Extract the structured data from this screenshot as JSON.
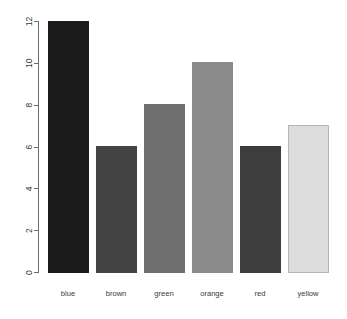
{
  "chart_data": {
    "type": "bar",
    "title": "",
    "subtitle": "",
    "xlabel": "",
    "ylabel": "",
    "categories": [
      "blue",
      "brown",
      "green",
      "orange",
      "red",
      "yellow"
    ],
    "values": [
      12,
      6,
      8,
      10,
      6,
      7
    ],
    "ylim": [
      0,
      12
    ],
    "yticks": [
      0,
      2,
      4,
      6,
      8,
      10,
      12
    ],
    "ytick_labels": [
      "0",
      "2",
      "4",
      "6",
      "8",
      "10",
      "12"
    ],
    "grid": false,
    "legend": false,
    "legend_position": "none",
    "y_axis_label_rotation": 90,
    "bar_colors": [
      "#1a1a1a",
      "#434343",
      "#6e6e6e",
      "#8a8a8a",
      "#3d3d3d",
      "#dcdcdc"
    ],
    "bar_border_colors": [
      "#1a1a1a",
      "#434343",
      "#6e6e6e",
      "#8a8a8a",
      "#3d3d3d",
      "#b4b4b4"
    ],
    "background_color": "#ffffff",
    "axis_color": "#6b6b6b",
    "text_color": "#3a3a3a"
  },
  "geometry": {
    "width": 347,
    "height": 319,
    "plot_left": 38,
    "plot_baseline": 272,
    "plot_top": 21,
    "bar_width": 40,
    "bar_gap": 8,
    "first_bar_left": 48,
    "tick_length": 5,
    "label_baseline_y": 296
  }
}
